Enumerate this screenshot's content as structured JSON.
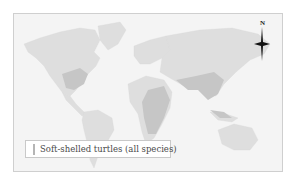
{
  "map": {
    "type": "world distribution map",
    "land_color": "#dedede",
    "range_color": "#c7c7c7",
    "background_color": "#f4f4f4",
    "highlighted_regions": [
      "Eastern United States",
      "Africa (central/east)",
      "India",
      "Southeast Asia",
      "China",
      "Indonesia"
    ]
  },
  "legend": {
    "label": "Soft-shelled turtles (all species)",
    "swatch_color": "#c2c2c2"
  },
  "compass": {
    "label": "N"
  }
}
